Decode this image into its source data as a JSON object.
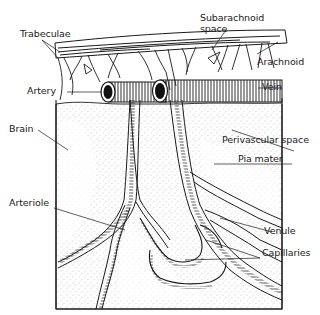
{
  "diagram": {
    "type": "anatomical-illustration",
    "labels": {
      "trabeculae": "Trabeculae",
      "subarachnoid_space_line1": "Subarachnoid",
      "subarachnoid_space_line2": "space",
      "arachnoid": "Arachnoid",
      "artery": "Artery",
      "vein": "Vein",
      "brain": "Brain",
      "perivascular_space": "Perivascular space",
      "pia_mater": "Pia mater",
      "arteriole": "Arteriole",
      "venule": "Venule",
      "capillaries": "Capillaries"
    },
    "colors": {
      "ink": "#1a1a1a",
      "stipple": "#8a8a8a",
      "background": "#ffffff"
    }
  }
}
